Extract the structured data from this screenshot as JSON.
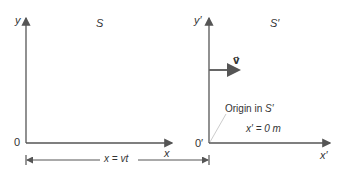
{
  "frame_s": {
    "title": "S",
    "y_label": "y",
    "x_label": "x",
    "origin_label": "0"
  },
  "frame_s_prime": {
    "title": "S′",
    "y_label": "y′",
    "x_label": "x′",
    "origin_label": "0′",
    "velocity_label": "v⃗",
    "origin_note": "Origin in S′",
    "position_eq": "x′ = 0  m"
  },
  "displacement": {
    "label": "x = vt"
  },
  "colors": {
    "axis": "#555555",
    "arrow": "#666666",
    "leader": "#cccccc",
    "text": "#333333"
  }
}
